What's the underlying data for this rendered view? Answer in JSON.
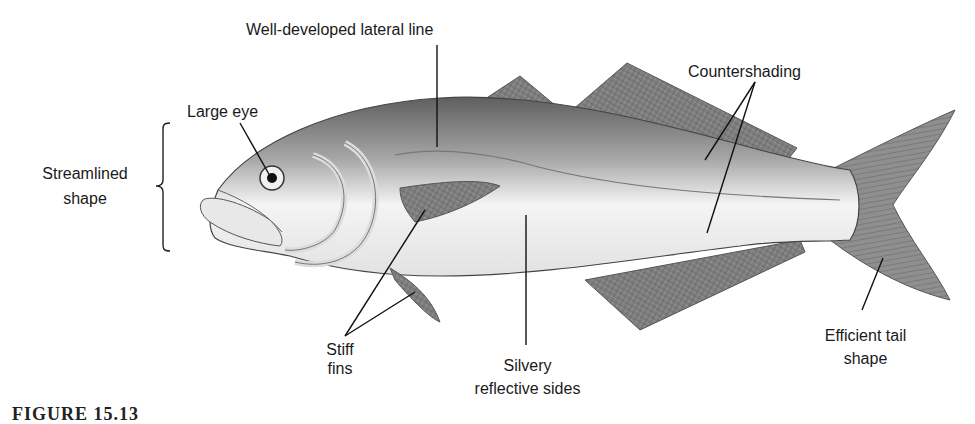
{
  "diagram": {
    "labels": {
      "lateral_line": "Well-developed lateral line",
      "countershading": "Countershading",
      "large_eye": "Large eye",
      "streamlined_line1": "Streamlined",
      "streamlined_line2": "shape",
      "stiff_line1": "Stiff",
      "stiff_line2": "fins",
      "silvery_line1": "Silvery",
      "silvery_line2": "reflective sides",
      "tail_line1": "Efficient tail",
      "tail_line2": "shape"
    },
    "caption": "FIGURE 15.13",
    "colors": {
      "background": "#ffffff",
      "text": "#1a1a1a",
      "fish_dark": "#6e6e6e",
      "fish_light": "#f2f2f2",
      "fin": "#8a8a8a",
      "leader_line": "#111111"
    }
  }
}
